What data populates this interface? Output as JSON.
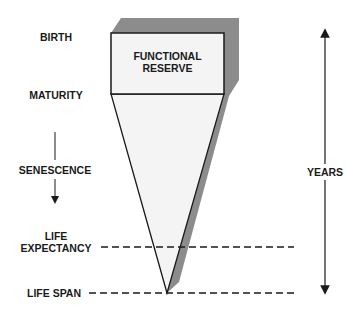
{
  "diagram": {
    "box_label_line1": "FUNCTIONAL",
    "box_label_line2": "RESERVE",
    "stages": {
      "birth": "BIRTH",
      "maturity": "MATURITY",
      "senescence": "SENESCENCE",
      "life_expectancy_line1": "LIFE",
      "life_expectancy_line2": "EXPECTANCY",
      "life_span": "LIFE SPAN"
    },
    "axis_label": "YEARS",
    "colors": {
      "shadow": "#8c8c8c",
      "box_fill": "#f4f4f4",
      "line": "#1a1a1a"
    }
  }
}
